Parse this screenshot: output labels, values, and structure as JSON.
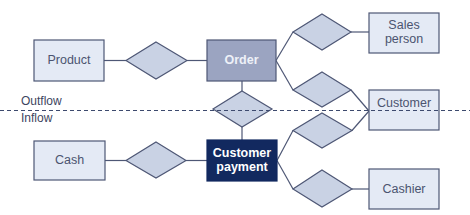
{
  "diagram": {
    "type": "entity-relationship",
    "colors": {
      "entity_light_fill": "#e4eaf5",
      "entity_light_text": "#4b5470",
      "entity_mid_fill": "#9ba4c1",
      "entity_mid_text": "#eef1f8",
      "entity_dark_fill": "#12295f",
      "entity_dark_text": "#ffffff",
      "relationship_fill": "#c9d2e4",
      "stroke": "#4e5775",
      "boundary": "#3d4a6e"
    },
    "boundary": {
      "style": "dashed",
      "upper_label": "Outflow",
      "lower_label": "Inflow"
    },
    "entities": [
      {
        "id": "product",
        "lines": [
          "Product"
        ],
        "style": "light"
      },
      {
        "id": "order",
        "lines": [
          "Order"
        ],
        "style": "mid"
      },
      {
        "id": "sales-person",
        "lines": [
          "Sales",
          "person"
        ],
        "style": "light"
      },
      {
        "id": "customer",
        "lines": [
          "Customer"
        ],
        "style": "light"
      },
      {
        "id": "cash",
        "lines": [
          "Cash"
        ],
        "style": "light"
      },
      {
        "id": "customer-payment",
        "lines": [
          "Customer",
          "payment"
        ],
        "style": "dark"
      },
      {
        "id": "cashier",
        "lines": [
          "Cashier"
        ],
        "style": "light"
      }
    ],
    "relationships": [
      {
        "id": "product-order",
        "connects": [
          "product",
          "order"
        ]
      },
      {
        "id": "order-salesperson",
        "connects": [
          "order",
          "sales-person"
        ]
      },
      {
        "id": "order-customer",
        "connects": [
          "order",
          "customer"
        ]
      },
      {
        "id": "order-payment",
        "connects": [
          "order",
          "customer-payment"
        ]
      },
      {
        "id": "payment-customer",
        "connects": [
          "customer-payment",
          "customer"
        ]
      },
      {
        "id": "cash-payment",
        "connects": [
          "cash",
          "customer-payment"
        ]
      },
      {
        "id": "payment-cashier",
        "connects": [
          "customer-payment",
          "cashier"
        ]
      }
    ]
  }
}
